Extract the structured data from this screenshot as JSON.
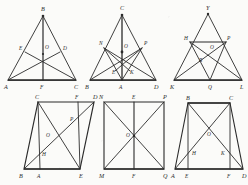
{
  "page": {
    "background_color": "#fbfbf9",
    "ink_color": "#2b2b2b",
    "figure_count": 6
  },
  "figures": [
    {
      "id": "fig-1",
      "name": "isosceles-triangle-medians",
      "shape": "triangle",
      "caption": "",
      "vertices": [
        {
          "label": "A",
          "x": 8,
          "y": 78
        },
        {
          "label": "B",
          "x": 43,
          "y": 14
        },
        {
          "label": "C",
          "x": 76,
          "y": 78
        }
      ],
      "points": [
        {
          "label": "E",
          "x": 25,
          "y": 50
        },
        {
          "label": "D",
          "x": 60,
          "y": 50
        },
        {
          "label": "O",
          "x": 43,
          "y": 52
        },
        {
          "label": "F",
          "x": 43,
          "y": 78
        }
      ],
      "segments": [
        [
          "A",
          "B"
        ],
        [
          "B",
          "C"
        ],
        [
          "A",
          "C"
        ],
        [
          "B",
          "F"
        ],
        [
          "A",
          "D"
        ],
        [
          "C",
          "E"
        ]
      ]
    },
    {
      "id": "fig-2",
      "name": "triangle-with-cevians",
      "shape": "triangle",
      "caption": "",
      "vertices": [
        {
          "label": "B",
          "x": 8,
          "y": 78
        },
        {
          "label": "C",
          "x": 40,
          "y": 13
        },
        {
          "label": "D",
          "x": 74,
          "y": 78
        }
      ],
      "points": [
        {
          "label": "N",
          "x": 22,
          "y": 46
        },
        {
          "label": "P",
          "x": 60,
          "y": 46
        },
        {
          "label": "O",
          "x": 40,
          "y": 50
        },
        {
          "label": "E",
          "x": 33,
          "y": 69
        },
        {
          "label": "K",
          "x": 48,
          "y": 69
        },
        {
          "label": "A",
          "x": 40,
          "y": 78
        }
      ],
      "segments": [
        [
          "B",
          "C"
        ],
        [
          "C",
          "D"
        ],
        [
          "B",
          "D"
        ],
        [
          "C",
          "A"
        ],
        [
          "B",
          "P"
        ],
        [
          "D",
          "N"
        ],
        [
          "N",
          "A"
        ],
        [
          "P",
          "A"
        ],
        [
          "N",
          "K"
        ],
        [
          "P",
          "E"
        ]
      ]
    },
    {
      "id": "fig-3",
      "name": "triangle-with-inscribed-rectangle",
      "shape": "triangle",
      "caption": "",
      "vertices": [
        {
          "label": "K",
          "x": 8,
          "y": 78
        },
        {
          "label": "Y",
          "x": 42,
          "y": 12
        },
        {
          "label": "L",
          "x": 76,
          "y": 78
        }
      ],
      "points": [
        {
          "label": "H",
          "x": 24,
          "y": 40
        },
        {
          "label": "P",
          "x": 60,
          "y": 40
        },
        {
          "label": "O",
          "x": 44,
          "y": 44
        },
        {
          "label": "R",
          "x": 36,
          "y": 58
        },
        {
          "label": "Q",
          "x": 44,
          "y": 78
        }
      ],
      "segments": [
        [
          "K",
          "Y"
        ],
        [
          "Y",
          "L"
        ],
        [
          "K",
          "L"
        ],
        [
          "H",
          "P"
        ],
        [
          "H",
          "Q"
        ],
        [
          "P",
          "Q"
        ],
        [
          "K",
          "P"
        ],
        [
          "H",
          "L"
        ],
        [
          "Y",
          "Q"
        ]
      ]
    },
    {
      "id": "fig-4",
      "name": "parallelogram-with-diagonals",
      "shape": "parallelogram",
      "caption": "",
      "vertices": [
        {
          "label": "B",
          "x": 6,
          "y": 76
        },
        {
          "label": "C",
          "x": 20,
          "y": 9
        },
        {
          "label": "D",
          "x": 76,
          "y": 9
        },
        {
          "label": "E",
          "x": 62,
          "y": 76
        }
      ],
      "points": [
        {
          "label": "F",
          "x": 60,
          "y": 9
        },
        {
          "label": "A",
          "x": 22,
          "y": 76
        },
        {
          "label": "O",
          "x": 33,
          "y": 44
        },
        {
          "label": "P",
          "x": 52,
          "y": 29
        },
        {
          "label": "H",
          "x": 26,
          "y": 62
        }
      ],
      "segments": [
        [
          "B",
          "C"
        ],
        [
          "C",
          "D"
        ],
        [
          "D",
          "E"
        ],
        [
          "B",
          "E"
        ],
        [
          "C",
          "E"
        ],
        [
          "B",
          "D"
        ],
        [
          "C",
          "A"
        ],
        [
          "F",
          "E"
        ]
      ]
    },
    {
      "id": "fig-5",
      "name": "rectangle-with-diagonals",
      "shape": "rectangle",
      "caption": "",
      "vertices": [
        {
          "label": "M",
          "x": 8,
          "y": 76
        },
        {
          "label": "N",
          "x": 8,
          "y": 9
        },
        {
          "label": "P",
          "x": 68,
          "y": 9
        },
        {
          "label": "Q",
          "x": 68,
          "y": 76
        }
      ],
      "points": [
        {
          "label": "E",
          "x": 38,
          "y": 9
        },
        {
          "label": "F",
          "x": 38,
          "y": 76
        },
        {
          "label": "O",
          "x": 38,
          "y": 43
        }
      ],
      "segments": [
        [
          "M",
          "N"
        ],
        [
          "N",
          "P"
        ],
        [
          "P",
          "Q"
        ],
        [
          "M",
          "Q"
        ],
        [
          "N",
          "Q"
        ],
        [
          "M",
          "P"
        ],
        [
          "E",
          "F"
        ]
      ]
    },
    {
      "id": "fig-6",
      "name": "trapezoid-with-diagonals",
      "shape": "trapezoid",
      "caption": "",
      "vertices": [
        {
          "label": "A",
          "x": 5,
          "y": 76
        },
        {
          "label": "B",
          "x": 18,
          "y": 10
        },
        {
          "label": "C",
          "x": 60,
          "y": 10
        },
        {
          "label": "D",
          "x": 73,
          "y": 76
        }
      ],
      "points": [
        {
          "label": "E",
          "x": 18,
          "y": 76
        },
        {
          "label": "F",
          "x": 60,
          "y": 76
        },
        {
          "label": "O",
          "x": 39,
          "y": 40
        },
        {
          "label": "H",
          "x": 25,
          "y": 59
        },
        {
          "label": "K",
          "x": 53,
          "y": 59
        }
      ],
      "segments": [
        [
          "A",
          "B"
        ],
        [
          "B",
          "C"
        ],
        [
          "C",
          "D"
        ],
        [
          "A",
          "D"
        ],
        [
          "A",
          "C"
        ],
        [
          "B",
          "D"
        ],
        [
          "B",
          "E"
        ],
        [
          "C",
          "F"
        ]
      ]
    }
  ]
}
